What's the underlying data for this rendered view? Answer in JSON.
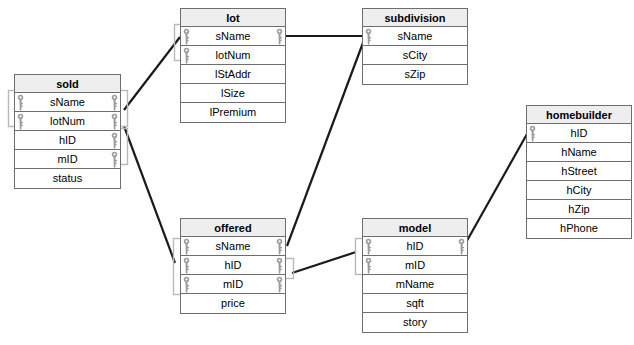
{
  "diagram": {
    "type": "entity-relationship-diagram",
    "background": "#ffffff",
    "line_color": "#1a1a1a",
    "bracket_color": "#b9b9b9",
    "header_fill": "#eeeeee",
    "border_color": "#6e6e6e",
    "key_color": "#9a9a9a"
  },
  "entities": [
    {
      "id": "sold",
      "name": "sold",
      "x": 14,
      "y": 74,
      "w": 107,
      "attributes": [
        {
          "name": "sName",
          "key_left": true,
          "key_right": true
        },
        {
          "name": "lotNum",
          "key_left": true,
          "key_right": true
        },
        {
          "name": "hID",
          "key_left": false,
          "key_right": true
        },
        {
          "name": "mID",
          "key_left": false,
          "key_right": true
        },
        {
          "name": "status",
          "key_left": false,
          "key_right": false
        }
      ]
    },
    {
      "id": "lot",
      "name": "lot",
      "x": 180,
      "y": 8,
      "w": 106,
      "attributes": [
        {
          "name": "lStAddr",
          "key_left": false,
          "key_right": false,
          "order": 3
        },
        {
          "name": "sName",
          "key_left": true,
          "key_right": true
        },
        {
          "name": "lotNum",
          "key_left": true,
          "key_right": false
        },
        {
          "name": "lStAddr",
          "key_left": false,
          "key_right": false
        },
        {
          "name": "lSize",
          "key_left": false,
          "key_right": false
        },
        {
          "name": "lPremium",
          "key_left": false,
          "key_right": false
        }
      ]
    },
    {
      "id": "subdivision",
      "name": "subdivision",
      "x": 362,
      "y": 8,
      "w": 106,
      "attributes": [
        {
          "name": "sName",
          "key_left": true,
          "key_right": false
        },
        {
          "name": "sCity",
          "key_left": false,
          "key_right": false
        },
        {
          "name": "sZip",
          "key_left": false,
          "key_right": false
        }
      ]
    },
    {
      "id": "offered",
      "name": "offered",
      "x": 180,
      "y": 218,
      "w": 106,
      "attributes": [
        {
          "name": "sName",
          "key_left": true,
          "key_right": true
        },
        {
          "name": "hID",
          "key_left": true,
          "key_right": true
        },
        {
          "name": "mID",
          "key_left": true,
          "key_right": true
        },
        {
          "name": "price",
          "key_left": false,
          "key_right": false
        }
      ]
    },
    {
      "id": "model",
      "name": "model",
      "x": 362,
      "y": 218,
      "w": 106,
      "attributes": [
        {
          "name": "hID",
          "key_left": true,
          "key_right": true
        },
        {
          "name": "mID",
          "key_left": true,
          "key_right": false
        },
        {
          "name": "mName",
          "key_left": false,
          "key_right": false
        },
        {
          "name": "sqft",
          "key_left": false,
          "key_right": false
        },
        {
          "name": "story",
          "key_left": false,
          "key_right": false
        }
      ]
    },
    {
      "id": "homebuilder",
      "name": "homebuilder",
      "x": 526,
      "y": 105,
      "w": 106,
      "attributes": [
        {
          "name": "hID",
          "key_left": true,
          "key_right": false
        },
        {
          "name": "hName",
          "key_left": false,
          "key_right": false
        },
        {
          "name": "hStreet",
          "key_left": false,
          "key_right": false
        },
        {
          "name": "hCity",
          "key_left": false,
          "key_right": false
        },
        {
          "name": "hZip",
          "key_left": false,
          "key_right": false
        },
        {
          "name": "hPhone",
          "key_left": false,
          "key_right": false
        }
      ]
    }
  ],
  "relationships": [
    {
      "id": "sold-lot",
      "from": "sold",
      "to": "lot",
      "x1": 124,
      "y1": 110,
      "x2": 180,
      "y2": 37
    },
    {
      "id": "lot-subdivision",
      "from": "lot",
      "to": "subdivision",
      "x1": 286,
      "y1": 36,
      "x2": 362,
      "y2": 36
    },
    {
      "id": "sold-offered",
      "from": "sold",
      "to": "offered",
      "x1": 124,
      "y1": 126,
      "x2": 175,
      "y2": 263
    },
    {
      "id": "subdivision-offered",
      "from": "subdivision",
      "to": "offered",
      "x1": 364,
      "y1": 40,
      "x2": 287,
      "y2": 246
    },
    {
      "id": "offered-model",
      "from": "offered",
      "to": "model",
      "x1": 292,
      "y1": 273,
      "x2": 356,
      "y2": 252
    },
    {
      "id": "model-homebuilder",
      "from": "model",
      "to": "homebuilder",
      "x1": 464,
      "y1": 246,
      "x2": 527,
      "y2": 134
    }
  ],
  "brackets": [
    {
      "id": "sold-left-bracket",
      "x": 8,
      "y": 90,
      "w": 9,
      "h": 36
    },
    {
      "id": "sold-right-bracket",
      "x": 117,
      "y": 90,
      "w": 10,
      "h": 36
    },
    {
      "id": "sold-right-bracket-lower",
      "x": 117,
      "y": 128,
      "w": 10,
      "h": 36
    },
    {
      "id": "lot-left-bracket",
      "x": 174,
      "y": 24,
      "w": 10,
      "h": 36
    },
    {
      "id": "offered-left-bracket",
      "x": 173,
      "y": 238,
      "w": 10,
      "h": 56
    },
    {
      "id": "offered-right-bracket",
      "x": 282,
      "y": 258,
      "w": 11,
      "h": 20
    },
    {
      "id": "model-left-bracket",
      "x": 355,
      "y": 238,
      "w": 10,
      "h": 36
    }
  ]
}
